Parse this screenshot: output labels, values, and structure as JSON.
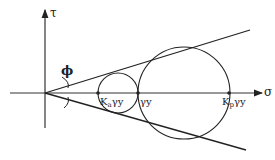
{
  "diagram": {
    "type": "mohr-circle",
    "axes": {
      "y_label": "τ",
      "x_label": "σ"
    },
    "angle_label": "ϕ",
    "points": [
      {
        "label_main": "K",
        "label_sub": "a",
        "label_rest": "γy",
        "x": 98
      },
      {
        "label_main": "",
        "label_sub": "",
        "label_rest": "γy",
        "x": 138
      },
      {
        "label_main": "K",
        "label_sub": "p",
        "label_rest": "γy",
        "x": 229
      }
    ],
    "circles": [
      {
        "name": "active",
        "cx": 118,
        "r": 20
      },
      {
        "name": "passive",
        "cx": 184,
        "r": 46
      }
    ],
    "colors": {
      "ink": "#222222",
      "background": "#ffffff"
    }
  }
}
